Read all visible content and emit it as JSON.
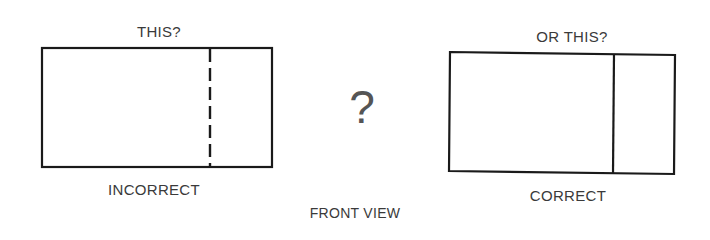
{
  "diagram": {
    "left_option": {
      "caption": "THIS?",
      "verdict": "INCORRECT",
      "divider_style": "dashed"
    },
    "center_symbol": "?",
    "right_option": {
      "caption": "OR THIS?",
      "verdict": "CORRECT",
      "divider_style": "solid"
    },
    "footer_label": "FRONT VIEW",
    "colors": {
      "line": "#1a1a1a",
      "text": "#3a3a3a"
    }
  }
}
